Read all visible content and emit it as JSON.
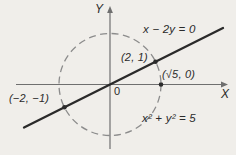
{
  "figure": {
    "colors": {
      "background": "#f0eeea",
      "axis": "#6f6f6f",
      "circle": "#8c8c8c",
      "line": "#2a2a2a",
      "ink": "#2b2b2b"
    },
    "labels": {
      "y_axis": "Y",
      "x_axis": "X",
      "line_equation": "x − 2y = 0",
      "circle_equation": "x² + y² = 5",
      "origin": "0",
      "point_upper": "(2, 1)",
      "point_right": "(√5, 0)",
      "point_lower": "(−2, −1)"
    },
    "geometry": {
      "circle_equation": "x² + y² = 5",
      "line_equation": "x − 2y = 0",
      "points": {
        "upper_intersection": [
          2,
          1
        ],
        "lower_intersection": [
          -2,
          -1
        ],
        "circle_x_intercept": [
          "√5",
          0
        ]
      }
    }
  }
}
